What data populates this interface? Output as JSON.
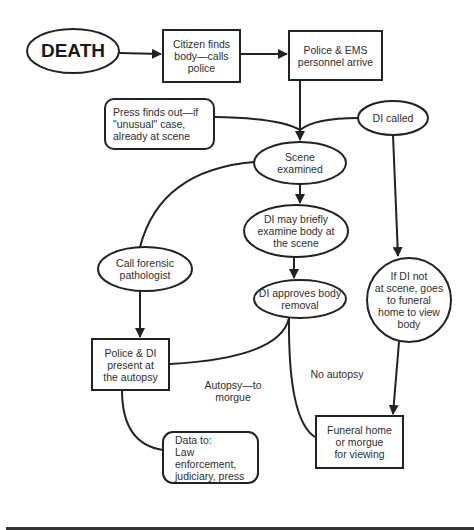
{
  "diagram": {
    "type": "flowchart",
    "stroke_color": "#222222",
    "background": "#ffffff",
    "nodes": {
      "death": {
        "shape": "ellipse",
        "label": "DEATH"
      },
      "citizen": {
        "shape": "rectangle",
        "label": "Citizen finds\nbody—calls\npolice"
      },
      "police_ems": {
        "shape": "rectangle",
        "label": "Police & EMS\npersonnel arrive"
      },
      "press": {
        "shape": "rounded-rectangle",
        "label": "Press finds out—if\n\"unusual\" case,\nalready at scene"
      },
      "di_called": {
        "shape": "ellipse",
        "label": "DI called"
      },
      "scene_examined": {
        "shape": "ellipse",
        "label": "Scene\nexamined"
      },
      "di_examine": {
        "shape": "ellipse",
        "label": "DI may briefly\nexamine body at\nthe scene"
      },
      "call_pathologist": {
        "shape": "ellipse",
        "label": "Call forensic\npathologist"
      },
      "di_approves": {
        "shape": "ellipse",
        "label": "DI approves body\nremoval"
      },
      "di_not_at_scene": {
        "shape": "circle",
        "label": "If DI not\nat scene, goes\nto funeral\nhome to view\nbody"
      },
      "police_di_autopsy": {
        "shape": "rectangle",
        "label": "Police & DI\npresent at\nthe autopsy"
      },
      "data_to": {
        "shape": "rounded-rectangle",
        "label": "Data to:\nLaw enforcement,\njudiciary, press"
      },
      "funeral_home": {
        "shape": "rectangle",
        "label": "Funeral home\nor morgue\nfor viewing"
      }
    },
    "edge_labels": {
      "autopsy_to_morgue": "Autopsy—to\nmorgue",
      "no_autopsy": "No autopsy"
    },
    "edges": [
      {
        "from": "DEATH",
        "to": "Citizen finds body—calls police",
        "arrow": true
      },
      {
        "from": "Citizen finds body—calls police",
        "to": "Police & EMS personnel arrive",
        "arrow": true
      },
      {
        "from": "Police & EMS personnel arrive",
        "to": "Scene examined",
        "arrow": true
      },
      {
        "from": "Press finds out",
        "to": "Scene examined",
        "arrow": false
      },
      {
        "from": "DI called",
        "to": "Scene examined",
        "arrow": false
      },
      {
        "from": "Scene examined",
        "to": "DI may briefly examine body at the scene",
        "arrow": true
      },
      {
        "from": "Scene examined",
        "to": "Call forensic pathologist",
        "arrow": false
      },
      {
        "from": "DI may briefly examine body at the scene",
        "to": "DI approves body removal",
        "arrow": true
      },
      {
        "from": "DI called",
        "to": "If DI not at scene, goes to funeral home to view body",
        "arrow": true
      },
      {
        "from": "Call forensic pathologist",
        "to": "Police & DI present at the autopsy",
        "arrow": true
      },
      {
        "from": "DI approves body removal",
        "to": "Police & DI present at the autopsy",
        "label": "Autopsy—to morgue",
        "arrow": false
      },
      {
        "from": "DI approves body removal",
        "to": "Funeral home or morgue for viewing",
        "label": "No autopsy",
        "arrow": false
      },
      {
        "from": "If DI not at scene, goes to funeral home to view body",
        "to": "Funeral home or morgue for viewing",
        "arrow": true
      },
      {
        "from": "Police & DI present at the autopsy",
        "to": "Data to: Law enforcement, judiciary, press",
        "arrow": false
      }
    ]
  }
}
